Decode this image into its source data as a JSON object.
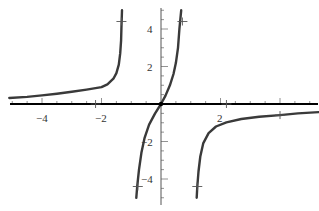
{
  "chart_data": {
    "type": "line",
    "title": "",
    "xlabel": "",
    "ylabel": "",
    "xlim": [
      -5.1,
      5.3
    ],
    "ylim": [
      -5.2,
      5.2
    ],
    "grid": false,
    "legend": null,
    "x_ticks": [
      -4,
      -2,
      2
    ],
    "y_ticks": [
      4,
      2,
      -2,
      -4
    ],
    "x_tick_labels": [
      "−4",
      "−2",
      "2"
    ],
    "y_tick_labels": [
      "4",
      "2",
      "−2",
      "−4"
    ],
    "series": [
      {
        "name": "left-branch",
        "points": [
          [
            -5.1,
            0.32
          ],
          [
            -4.5,
            0.38
          ],
          [
            -4,
            0.46
          ],
          [
            -3.5,
            0.55
          ],
          [
            -3,
            0.65
          ],
          [
            -2.5,
            0.77
          ],
          [
            -2,
            0.9
          ],
          [
            -1.8,
            1.05
          ],
          [
            -1.6,
            1.35
          ],
          [
            -1.5,
            1.65
          ],
          [
            -1.42,
            2.1
          ],
          [
            -1.37,
            2.7
          ],
          [
            -1.34,
            3.4
          ],
          [
            -1.33,
            4
          ],
          [
            -1.31,
            5.0
          ]
        ]
      },
      {
        "name": "middle-branch",
        "points": [
          [
            -0.83,
            -5.0
          ],
          [
            -0.8,
            -4.4
          ],
          [
            -0.74,
            -3.5
          ],
          [
            -0.66,
            -2.6
          ],
          [
            -0.55,
            -1.8
          ],
          [
            -0.4,
            -1.1
          ],
          [
            -0.2,
            -0.5
          ],
          [
            0,
            0
          ],
          [
            0.15,
            0.45
          ],
          [
            0.3,
            1.0
          ],
          [
            0.42,
            1.6
          ],
          [
            0.5,
            2.2
          ],
          [
            0.57,
            3.0
          ],
          [
            0.62,
            4.0
          ],
          [
            0.68,
            5.0
          ]
        ]
      },
      {
        "name": "right-branch",
        "points": [
          [
            1.2,
            -5.0
          ],
          [
            1.22,
            -4.4
          ],
          [
            1.26,
            -3.6
          ],
          [
            1.32,
            -2.8
          ],
          [
            1.42,
            -2.1
          ],
          [
            1.6,
            -1.55
          ],
          [
            1.85,
            -1.2
          ],
          [
            2.2,
            -0.98
          ],
          [
            2.7,
            -0.8
          ],
          [
            3.3,
            -0.68
          ],
          [
            4,
            -0.59
          ],
          [
            4.6,
            -0.5
          ],
          [
            5.3,
            -0.43
          ]
        ]
      }
    ],
    "annotations": [
      {
        "type": "tick-mark",
        "x": -1.33,
        "y": 4.4
      },
      {
        "type": "tick-mark",
        "x": 0.72,
        "y": 4.4
      },
      {
        "type": "tick-mark",
        "x": -0.78,
        "y": -4.4
      },
      {
        "type": "tick-mark",
        "x": 1.22,
        "y": -4.4
      },
      {
        "type": "tick-mark",
        "x": 4,
        "y": -0.59
      },
      {
        "type": "tick-mark",
        "x": -2.2,
        "y": 0
      },
      {
        "type": "tick-mark",
        "x": 2.2,
        "y": 0
      }
    ],
    "axis_color": "#000000",
    "curve_color": "#3a3a3a"
  }
}
